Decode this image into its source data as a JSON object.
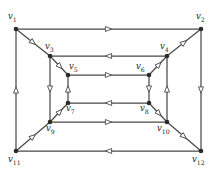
{
  "figure": {
    "background_color": "#ffffff",
    "edge_color": "#4a4a4a",
    "node_color": "#2b2b2b",
    "arrowhead_fill": "#ffffff",
    "arrowhead_stroke": "#4a4a4a"
  },
  "nodes": [
    {
      "id": "v1",
      "label": "v",
      "subscript": "1",
      "x": 16,
      "y": 29,
      "label_x": 8,
      "label_y": 12
    },
    {
      "id": "v2",
      "label": "v",
      "subscript": "2",
      "x": 201,
      "y": 29,
      "label_x": 196,
      "label_y": 12
    },
    {
      "id": "v3",
      "label": "v",
      "subscript": "3",
      "x": 50,
      "y": 56,
      "label_x": 45,
      "label_y": 42
    },
    {
      "id": "v4",
      "label": "v",
      "subscript": "4",
      "x": 167,
      "y": 56,
      "label_x": 160,
      "label_y": 42
    },
    {
      "id": "v5",
      "label": "v",
      "subscript": "5",
      "x": 68,
      "y": 75,
      "label_x": 69,
      "label_y": 62
    },
    {
      "id": "v6",
      "label": "v",
      "subscript": "6",
      "x": 149,
      "y": 75,
      "label_x": 136,
      "label_y": 62
    },
    {
      "id": "v7",
      "label": "v",
      "subscript": "7",
      "x": 68,
      "y": 103,
      "label_x": 66,
      "label_y": 104
    },
    {
      "id": "v8",
      "label": "v",
      "subscript": "8",
      "x": 149,
      "y": 103,
      "label_x": 140,
      "label_y": 104
    },
    {
      "id": "v9",
      "label": "v",
      "subscript": "9",
      "x": 50,
      "y": 122,
      "label_x": 46,
      "label_y": 124
    },
    {
      "id": "v10",
      "label": "v",
      "subscript": "10",
      "x": 167,
      "y": 122,
      "label_x": 157,
      "label_y": 124
    },
    {
      "id": "v11",
      "label": "v",
      "subscript": "11",
      "x": 16,
      "y": 151,
      "label_x": 8,
      "label_y": 155
    },
    {
      "id": "v12",
      "label": "v",
      "subscript": "12",
      "x": 201,
      "y": 151,
      "label_x": 192,
      "label_y": 155
    }
  ],
  "edges": [
    {
      "id": "e-v1-v2",
      "from": "v1",
      "to": "v2",
      "direction": "right",
      "arrow_t": 0.5
    },
    {
      "id": "e-v2-v12",
      "from": "v2",
      "to": "v12",
      "direction": "down",
      "arrow_t": 0.5
    },
    {
      "id": "e-v12-v11",
      "from": "v12",
      "to": "v11",
      "direction": "left",
      "arrow_t": 0.5
    },
    {
      "id": "e-v11-v1",
      "from": "v11",
      "to": "v1",
      "direction": "up",
      "arrow_t": 0.5
    },
    {
      "id": "e-v1-v3",
      "from": "v1",
      "to": "v3",
      "direction": "down-right",
      "arrow_t": 0.5
    },
    {
      "id": "e-v4-v2",
      "from": "v4",
      "to": "v2",
      "direction": "up-right",
      "arrow_t": 0.5
    },
    {
      "id": "e-v11-v9",
      "from": "v11",
      "to": "v9",
      "direction": "up-right",
      "arrow_t": 0.5
    },
    {
      "id": "e-v10-v12",
      "from": "v10",
      "to": "v12",
      "direction": "down-right",
      "arrow_t": 0.5
    },
    {
      "id": "e-v4-v3",
      "from": "v4",
      "to": "v3",
      "direction": "left",
      "arrow_t": 0.5
    },
    {
      "id": "e-v3-v9",
      "from": "v3",
      "to": "v9",
      "direction": "down",
      "arrow_t": 0.5
    },
    {
      "id": "e-v9-v10",
      "from": "v9",
      "to": "v10",
      "direction": "right",
      "arrow_t": 0.5
    },
    {
      "id": "e-v10-v4",
      "from": "v10",
      "to": "v4",
      "direction": "up",
      "arrow_t": 0.5
    },
    {
      "id": "e-v3-v5",
      "from": "v3",
      "to": "v5",
      "direction": "down-right",
      "arrow_t": 0.55
    },
    {
      "id": "e-v6-v4",
      "from": "v6",
      "to": "v4",
      "direction": "up-right",
      "arrow_t": 0.55
    },
    {
      "id": "e-v9-v7",
      "from": "v9",
      "to": "v7",
      "direction": "up-right",
      "arrow_t": 0.55
    },
    {
      "id": "e-v8-v10",
      "from": "v8",
      "to": "v10",
      "direction": "down-right",
      "arrow_t": 0.55
    },
    {
      "id": "e-v5-v6",
      "from": "v5",
      "to": "v6",
      "direction": "right",
      "arrow_t": 0.5
    },
    {
      "id": "e-v6-v8",
      "from": "v6",
      "to": "v8",
      "direction": "down",
      "arrow_t": 0.5
    },
    {
      "id": "e-v8-v7",
      "from": "v8",
      "to": "v7",
      "direction": "left",
      "arrow_t": 0.5
    },
    {
      "id": "e-v7-v5",
      "from": "v7",
      "to": "v5",
      "direction": "up",
      "arrow_t": 0.5
    }
  ]
}
